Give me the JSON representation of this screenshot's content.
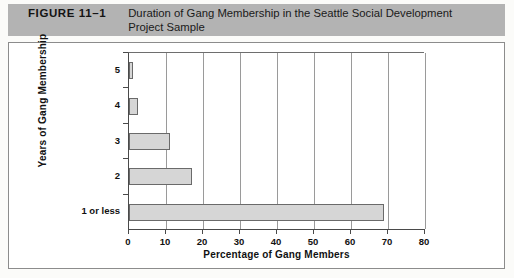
{
  "header": {
    "figure_number": "FIGURE 11–1",
    "title_line_1": "Duration of Gang Membership in the Seattle Social Development",
    "title_line_2": "Project Sample",
    "background_color": "#b3b3b3"
  },
  "chart_data": {
    "type": "bar",
    "orientation": "horizontal",
    "title": "Duration of Gang Membership in the Seattle Social Development Project Sample",
    "categories": [
      "1 or less",
      "2",
      "3",
      "4",
      "5"
    ],
    "values": [
      69,
      17,
      11,
      2.5,
      1
    ],
    "xlabel": "Percentage of Gang Members",
    "ylabel": "Years of Gang Membership",
    "xlim": [
      0,
      80
    ],
    "xticks": [
      0,
      10,
      20,
      30,
      40,
      50,
      60,
      70,
      80
    ],
    "xtick_labels": [
      "0",
      "10",
      "20",
      "30",
      "40",
      "50",
      "60",
      "70",
      "80"
    ],
    "grid": "vertical",
    "legend": null,
    "bar_fill_color": "#d6d6d6",
    "bar_edge_color": "#6a6a6a"
  }
}
